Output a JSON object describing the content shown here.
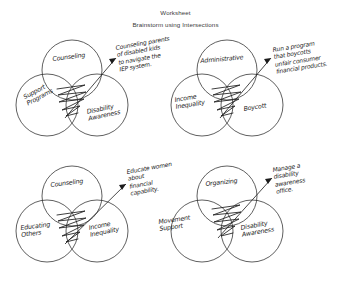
{
  "header": {
    "title": "Worksheet",
    "subtitle": "Brainstorm using Intersections"
  },
  "diagrams": [
    {
      "id": "venn-top-left",
      "labels": {
        "top": "Counseling",
        "bottom_left": "Support\nPrograms",
        "bottom_right": "Disability\nAwareness"
      },
      "annotation": "Counseling parents\nof disabled kids\nto navigate the\nIEP system."
    },
    {
      "id": "venn-top-right",
      "labels": {
        "top": "Administrative",
        "bottom_left": "Income\nInequality",
        "bottom_right": "Boycott"
      },
      "annotation": "Run a program\nthat boycotts\nunfair consumer\nfinancial products."
    },
    {
      "id": "venn-bottom-left",
      "labels": {
        "top": "Counseling",
        "bottom_left": "Educating\nOthers",
        "bottom_right": "Income\nInequality"
      },
      "annotation": "Educate women\nabout\nfinancial\ncapability."
    },
    {
      "id": "venn-bottom-right",
      "labels": {
        "top": "Organizing",
        "bottom_left": "Movement\nSupport",
        "bottom_right": "Disability\nAwareness"
      },
      "annotation": "Manage a\ndisability\nawareness\noffice."
    }
  ],
  "colors": {
    "ink": "#1c1c1c",
    "stroke": "#2b2b2b",
    "paper": "#ffffff"
  }
}
